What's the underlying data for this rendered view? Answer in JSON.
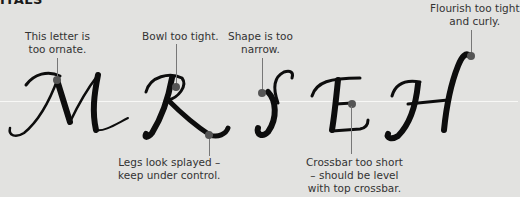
{
  "header": {
    "title": "ITALS"
  },
  "letters": [
    "M",
    "R",
    "S",
    "E",
    "H"
  ],
  "annotations": [
    {
      "id": "m",
      "text_line1": "This letter is",
      "text_line2": "too ornate."
    },
    {
      "id": "r-bowl",
      "text_line1": "Bowl too tight."
    },
    {
      "id": "s",
      "text_line1": "Shape is too",
      "text_line2": "narrow."
    },
    {
      "id": "h",
      "text_line1": "Flourish too tight",
      "text_line2": "and curly."
    },
    {
      "id": "r-legs",
      "text_line1": "Legs look splayed –",
      "text_line2": "keep under control."
    },
    {
      "id": "e",
      "text_line1": "Crossbar too short",
      "text_line2": "– should be level",
      "text_line3": "with top crossbar."
    }
  ],
  "colors": {
    "background": "#e2e2e0",
    "ink": "#0d0d0d",
    "marker": "#555555",
    "leader": "#777777",
    "guide_line": "#f8f8f6"
  }
}
